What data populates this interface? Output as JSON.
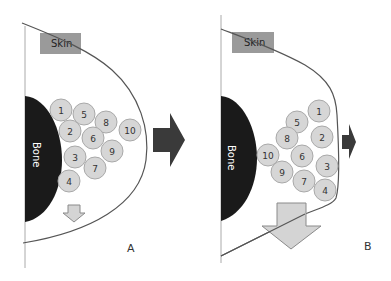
{
  "colors": {
    "bone": "#1a1a1a",
    "skin_box": "#9a9a9a",
    "skin_curve": "#555555",
    "circle_fill": "#d6d6d6",
    "circle_stroke": "#a9a9a9",
    "dark_arrow": "#3a3a3a",
    "light_arrow": "#d4d4d4",
    "light_arrow_stroke": "#8a8a8a",
    "axis_line": "#aaaaaa"
  },
  "panels": [
    {
      "id": "A",
      "label": "A",
      "skin_label": "Skin",
      "bone_label": "Bone",
      "circles": [
        {
          "n": "1",
          "x": 61,
          "y": 110
        },
        {
          "n": "5",
          "x": 84,
          "y": 114
        },
        {
          "n": "8",
          "x": 106,
          "y": 122
        },
        {
          "n": "10",
          "x": 130,
          "y": 130
        },
        {
          "n": "2",
          "x": 70,
          "y": 131
        },
        {
          "n": "6",
          "x": 93,
          "y": 138
        },
        {
          "n": "9",
          "x": 112,
          "y": 151
        },
        {
          "n": "3",
          "x": 75,
          "y": 157
        },
        {
          "n": "7",
          "x": 95,
          "y": 168
        },
        {
          "n": "4",
          "x": 69,
          "y": 181
        }
      ],
      "outward_arrow": "large",
      "downward_arrow": "small"
    },
    {
      "id": "B",
      "label": "B",
      "skin_label": "Skin",
      "bone_label": "Bone",
      "circles": [
        {
          "n": "1",
          "x": 319,
          "y": 111
        },
        {
          "n": "5",
          "x": 297,
          "y": 122
        },
        {
          "n": "2",
          "x": 322,
          "y": 137
        },
        {
          "n": "8",
          "x": 287,
          "y": 138
        },
        {
          "n": "6",
          "x": 302,
          "y": 156
        },
        {
          "n": "10",
          "x": 268,
          "y": 155
        },
        {
          "n": "3",
          "x": 327,
          "y": 166
        },
        {
          "n": "9",
          "x": 282,
          "y": 172
        },
        {
          "n": "7",
          "x": 304,
          "y": 181
        },
        {
          "n": "4",
          "x": 325,
          "y": 190
        }
      ],
      "outward_arrow": "small",
      "downward_arrow": "large"
    }
  ]
}
